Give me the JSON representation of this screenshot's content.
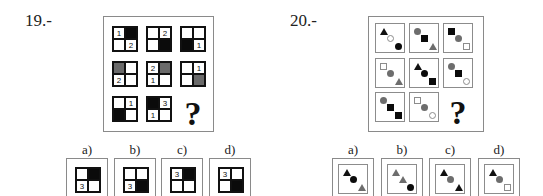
{
  "puzzles": [
    {
      "number": "19.-",
      "question_mark": "?",
      "grid": [
        [
          {
            "tl": {
              "fill": "white",
              "label": "1"
            },
            "tr": {
              "fill": "black",
              "label": ""
            },
            "bl": {
              "fill": "white",
              "label": ""
            },
            "br": {
              "fill": "white",
              "label": "2"
            }
          },
          {
            "tl": {
              "fill": "white",
              "label": ""
            },
            "tr": {
              "fill": "white",
              "label": "2"
            },
            "bl": {
              "fill": "white",
              "label": ""
            },
            "br": {
              "fill": "black",
              "label": ""
            }
          },
          {
            "tl": {
              "fill": "white",
              "label": ""
            },
            "tr": {
              "fill": "white",
              "label": ""
            },
            "bl": {
              "fill": "black",
              "label": ""
            },
            "br": {
              "fill": "white",
              "label": "1"
            }
          }
        ],
        [
          {
            "tl": {
              "fill": "gray",
              "label": ""
            },
            "tr": {
              "fill": "white",
              "label": ""
            },
            "bl": {
              "fill": "white",
              "label": "2"
            },
            "br": {
              "fill": "white",
              "label": ""
            }
          },
          {
            "tl": {
              "fill": "white",
              "label": "2"
            },
            "tr": {
              "fill": "gray",
              "label": ""
            },
            "bl": {
              "fill": "white",
              "label": "1"
            },
            "br": {
              "fill": "white",
              "label": ""
            }
          },
          {
            "tl": {
              "fill": "white",
              "label": ""
            },
            "tr": {
              "fill": "white",
              "label": "1"
            },
            "bl": {
              "fill": "white",
              "label": ""
            },
            "br": {
              "fill": "gray",
              "label": ""
            }
          }
        ],
        [
          {
            "tl": {
              "fill": "white",
              "label": ""
            },
            "tr": {
              "fill": "white",
              "label": "1"
            },
            "bl": {
              "fill": "black",
              "label": ""
            },
            "br": {
              "fill": "white",
              "label": ""
            }
          },
          {
            "tl": {
              "fill": "black",
              "label": ""
            },
            "tr": {
              "fill": "white",
              "label": "3"
            },
            "bl": {
              "fill": "white",
              "label": "1"
            },
            "br": {
              "fill": "white",
              "label": ""
            }
          }
        ]
      ],
      "options": [
        {
          "label": "a)",
          "cell": {
            "tl": {
              "fill": "white",
              "label": ""
            },
            "tr": {
              "fill": "black",
              "label": ""
            },
            "bl": {
              "fill": "white",
              "label": "3"
            },
            "br": {
              "fill": "white",
              "label": ""
            }
          }
        },
        {
          "label": "b)",
          "cell": {
            "tl": {
              "fill": "white",
              "label": ""
            },
            "tr": {
              "fill": "white",
              "label": ""
            },
            "bl": {
              "fill": "white",
              "label": "3"
            },
            "br": {
              "fill": "black",
              "label": ""
            }
          }
        },
        {
          "label": "c)",
          "cell": {
            "tl": {
              "fill": "white",
              "label": "3"
            },
            "tr": {
              "fill": "black",
              "label": ""
            },
            "bl": {
              "fill": "white",
              "label": ""
            },
            "br": {
              "fill": "white",
              "label": ""
            }
          }
        },
        {
          "label": "d)",
          "cell": {
            "tl": {
              "fill": "white",
              "label": "3"
            },
            "tr": {
              "fill": "white",
              "label": ""
            },
            "bl": {
              "fill": "white",
              "label": ""
            },
            "br": {
              "fill": "black",
              "label": ""
            }
          }
        }
      ]
    },
    {
      "number": "20.-",
      "question_mark": "?",
      "grid": [
        [
          [
            {
              "shape": "triangle",
              "fill": "black"
            },
            {
              "shape": "circle",
              "fill": "white"
            },
            {
              "shape": "circle",
              "fill": "black"
            }
          ],
          [
            {
              "shape": "circle",
              "fill": "gray"
            },
            {
              "shape": "square",
              "fill": "black"
            },
            {
              "shape": "triangle",
              "fill": "gray"
            }
          ],
          [
            {
              "shape": "square",
              "fill": "black"
            },
            {
              "shape": "circle",
              "fill": "gray"
            },
            {
              "shape": "square",
              "fill": "white"
            }
          ]
        ],
        [
          [
            {
              "shape": "square",
              "fill": "white"
            },
            {
              "shape": "circle",
              "fill": "gray"
            },
            {
              "shape": "triangle",
              "fill": "gray"
            }
          ],
          [
            {
              "shape": "triangle",
              "fill": "black"
            },
            {
              "shape": "circle",
              "fill": "black"
            },
            {
              "shape": "square",
              "fill": "black"
            }
          ],
          [
            {
              "shape": "circle",
              "fill": "gray"
            },
            {
              "shape": "square",
              "fill": "black"
            },
            {
              "shape": "circle",
              "fill": "white"
            }
          ]
        ],
        [
          [
            {
              "shape": "circle",
              "fill": "gray"
            },
            {
              "shape": "square",
              "fill": "black"
            },
            {
              "shape": "square",
              "fill": "black"
            }
          ],
          [
            {
              "shape": "square",
              "fill": "white"
            },
            {
              "shape": "circle",
              "fill": "gray"
            },
            {
              "shape": "circle",
              "fill": "white"
            }
          ]
        ]
      ],
      "options": [
        {
          "label": "a)",
          "shapes": [
            {
              "shape": "triangle",
              "fill": "black"
            },
            {
              "shape": "circle",
              "fill": "black"
            },
            {
              "shape": "triangle",
              "fill": "gray"
            }
          ]
        },
        {
          "label": "b)",
          "shapes": [
            {
              "shape": "triangle",
              "fill": "gray"
            },
            {
              "shape": "triangle",
              "fill": "gray"
            },
            {
              "shape": "circle",
              "fill": "black"
            }
          ]
        },
        {
          "label": "c)",
          "shapes": [
            {
              "shape": "triangle",
              "fill": "black"
            },
            {
              "shape": "circle",
              "fill": "gray"
            },
            {
              "shape": "triangle",
              "fill": "black"
            }
          ]
        },
        {
          "label": "d)",
          "shapes": [
            {
              "shape": "triangle",
              "fill": "black"
            },
            {
              "shape": "circle",
              "fill": "gray"
            },
            {
              "shape": "square",
              "fill": "white"
            }
          ]
        }
      ]
    }
  ]
}
